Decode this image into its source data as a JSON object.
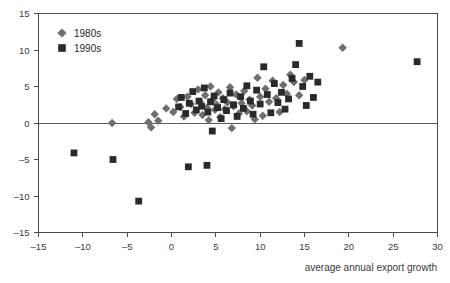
{
  "chart_data": {
    "type": "scatter",
    "title": "",
    "xlabel": "average annual export growth",
    "ylabel": "",
    "xlim": [
      -15,
      30
    ],
    "ylim": [
      -15,
      15
    ],
    "xticks": [
      -15,
      -10,
      -5,
      0,
      5,
      10,
      15,
      20,
      25,
      30
    ],
    "yticks": [
      -15,
      -10,
      -5,
      0,
      5,
      10,
      15
    ],
    "xtick_labels": [
      "–15",
      "–10",
      "–5",
      "0",
      "5",
      "10",
      "15",
      "20",
      "25",
      "30"
    ],
    "ytick_labels": [
      "–15",
      "–10",
      "–5",
      "0",
      "5",
      "10",
      "15"
    ],
    "grid": false,
    "zero_line": true,
    "legend_position": "top-left",
    "series": [
      {
        "name": "1980s",
        "marker": "diamond",
        "color": "#6e6e6e",
        "points": [
          [
            -6.7,
            0.0
          ],
          [
            -2.6,
            0.1
          ],
          [
            -2.3,
            -0.6
          ],
          [
            -1.9,
            1.2
          ],
          [
            -1.5,
            0.3
          ],
          [
            -0.6,
            2.0
          ],
          [
            0.2,
            1.5
          ],
          [
            0.6,
            3.3
          ],
          [
            1.0,
            2.2
          ],
          [
            1.4,
            0.9
          ],
          [
            1.8,
            3.6
          ],
          [
            2.2,
            2.6
          ],
          [
            2.6,
            1.4
          ],
          [
            3.0,
            4.6
          ],
          [
            3.2,
            2.9
          ],
          [
            3.5,
            1.1
          ],
          [
            3.8,
            3.8
          ],
          [
            4.0,
            2.1
          ],
          [
            4.2,
            0.4
          ],
          [
            4.4,
            5.0
          ],
          [
            4.6,
            3.1
          ],
          [
            4.9,
            1.8
          ],
          [
            5.1,
            2.5
          ],
          [
            5.3,
            4.2
          ],
          [
            5.5,
            0.8
          ],
          [
            5.8,
            3.4
          ],
          [
            6.0,
            1.9
          ],
          [
            6.3,
            2.8
          ],
          [
            6.6,
            4.9
          ],
          [
            6.8,
            -0.7
          ],
          [
            7.0,
            2.3
          ],
          [
            7.3,
            3.9
          ],
          [
            7.6,
            1.3
          ],
          [
            7.9,
            2.7
          ],
          [
            8.2,
            4.4
          ],
          [
            8.5,
            1.6
          ],
          [
            8.8,
            3.2
          ],
          [
            9.1,
            2.4
          ],
          [
            9.4,
            0.5
          ],
          [
            9.7,
            6.2
          ],
          [
            10.0,
            3.6
          ],
          [
            10.3,
            1.0
          ],
          [
            10.6,
            4.7
          ],
          [
            11.0,
            2.9
          ],
          [
            11.4,
            5.8
          ],
          [
            11.8,
            3.4
          ],
          [
            12.2,
            1.5
          ],
          [
            12.6,
            5.2
          ],
          [
            13.0,
            4.0
          ],
          [
            13.4,
            6.6
          ],
          [
            13.8,
            5.6
          ],
          [
            14.4,
            3.8
          ],
          [
            15.0,
            5.9
          ],
          [
            19.3,
            10.3
          ]
        ]
      },
      {
        "name": "1990s",
        "marker": "square",
        "color": "#2a2a2a",
        "points": [
          [
            -11.0,
            -4.1
          ],
          [
            -6.6,
            -5.0
          ],
          [
            -3.7,
            -10.7
          ],
          [
            1.9,
            -6.0
          ],
          [
            4.0,
            -5.8
          ],
          [
            4.6,
            -1.1
          ],
          [
            0.8,
            2.2
          ],
          [
            1.1,
            3.5
          ],
          [
            1.6,
            1.3
          ],
          [
            2.0,
            2.7
          ],
          [
            2.4,
            4.3
          ],
          [
            2.8,
            1.8
          ],
          [
            3.1,
            3.0
          ],
          [
            3.4,
            2.3
          ],
          [
            3.7,
            4.8
          ],
          [
            4.1,
            1.5
          ],
          [
            4.4,
            2.9
          ],
          [
            4.8,
            3.7
          ],
          [
            5.2,
            2.1
          ],
          [
            5.6,
            0.6
          ],
          [
            5.9,
            3.2
          ],
          [
            6.2,
            1.7
          ],
          [
            6.6,
            4.1
          ],
          [
            7.0,
            2.5
          ],
          [
            7.4,
            0.9
          ],
          [
            7.8,
            3.6
          ],
          [
            8.1,
            2.0
          ],
          [
            8.5,
            5.1
          ],
          [
            8.9,
            3.0
          ],
          [
            9.2,
            1.2
          ],
          [
            9.6,
            4.5
          ],
          [
            10.0,
            2.6
          ],
          [
            10.4,
            7.7
          ],
          [
            10.8,
            3.9
          ],
          [
            11.2,
            1.4
          ],
          [
            11.6,
            5.4
          ],
          [
            12.0,
            2.8
          ],
          [
            12.4,
            4.2
          ],
          [
            12.8,
            1.9
          ],
          [
            13.2,
            3.3
          ],
          [
            13.6,
            6.1
          ],
          [
            14.0,
            8.0
          ],
          [
            14.4,
            10.9
          ],
          [
            14.8,
            5.0
          ],
          [
            15.2,
            2.4
          ],
          [
            15.6,
            6.4
          ],
          [
            16.0,
            3.5
          ],
          [
            16.5,
            5.6
          ],
          [
            27.7,
            8.4
          ]
        ]
      }
    ]
  },
  "legend": {
    "entries": [
      {
        "label": "1980s"
      },
      {
        "label": "1990s"
      }
    ]
  }
}
